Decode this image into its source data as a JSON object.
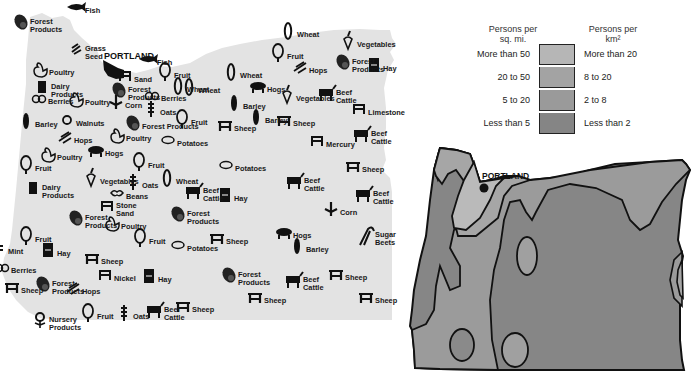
{
  "products_map": {
    "city": "PORTLAND",
    "state_fill": "#e4e4e4",
    "items": [
      {
        "label": "Fish",
        "icon": "fish-icon",
        "x": 88,
        "y": 11
      },
      {
        "label": "Forest\nProducts",
        "icon": "log-icon",
        "x": 33,
        "y": 26
      },
      {
        "label": "Grass\nSeed",
        "icon": "grass-seed-icon",
        "x": 88,
        "y": 53
      },
      {
        "label": "Poultry",
        "icon": "poultry-icon",
        "x": 52,
        "y": 73
      },
      {
        "label": "Dairy\nProducts",
        "icon": "dairy-icon",
        "x": 54,
        "y": 91
      },
      {
        "label": "Berries",
        "icon": "berries-icon",
        "x": 51,
        "y": 102
      },
      {
        "label": "Barley",
        "icon": "barley-icon",
        "x": 38,
        "y": 125
      },
      {
        "label": "Walnuts",
        "icon": "walnut-icon",
        "x": 79,
        "y": 124
      },
      {
        "label": "Hops",
        "icon": "hops-icon",
        "x": 77,
        "y": 141
      },
      {
        "label": "Poultry",
        "icon": "poultry-icon",
        "x": 88,
        "y": 103
      },
      {
        "label": "Sand",
        "icon": "sand-icon",
        "x": 137,
        "y": 80
      },
      {
        "label": "Forest\nProducts",
        "icon": "log-icon",
        "x": 131,
        "y": 94
      },
      {
        "label": "Corn",
        "icon": "corn-icon",
        "x": 128,
        "y": 106
      },
      {
        "label": "Fish",
        "icon": "fish-icon",
        "x": 160,
        "y": 63
      },
      {
        "label": "Fruit",
        "icon": "fruit-tree-icon",
        "x": 177,
        "y": 76
      },
      {
        "label": "Berries",
        "icon": "berries-icon",
        "x": 164,
        "y": 99
      },
      {
        "label": "Oats",
        "icon": "oats-icon",
        "x": 163,
        "y": 113
      },
      {
        "label": "Forest Products",
        "icon": "log-icon",
        "x": 145,
        "y": 127
      },
      {
        "label": "Wheat",
        "icon": "wheat-icon",
        "x": 201,
        "y": 91
      },
      {
        "label": "Fruit",
        "icon": "fruit-tree-icon",
        "x": 194,
        "y": 123
      },
      {
        "label": "Poultry",
        "icon": "poultry-icon",
        "x": 129,
        "y": 139
      },
      {
        "label": "Potatoes",
        "icon": "potato-icon",
        "x": 180,
        "y": 144
      },
      {
        "label": "Hogs",
        "icon": "hog-icon",
        "x": 108,
        "y": 154
      },
      {
        "label": "Poultry",
        "icon": "poultry-icon",
        "x": 60,
        "y": 158
      },
      {
        "label": "Fruit",
        "icon": "fruit-tree-icon",
        "x": 38,
        "y": 169
      },
      {
        "label": "Fruit",
        "icon": "fruit-tree-icon",
        "x": 151,
        "y": 166
      },
      {
        "label": "Vegetables",
        "icon": "vegetable-icon",
        "x": 103,
        "y": 182
      },
      {
        "label": "Wheat",
        "icon": "wheat-icon",
        "x": 179,
        "y": 182
      },
      {
        "label": "Oats",
        "icon": "oats-icon",
        "x": 145,
        "y": 186
      },
      {
        "label": "Beans",
        "icon": "beans-icon",
        "x": 129,
        "y": 197
      },
      {
        "label": "Dairy\nProducts",
        "icon": "dairy-icon",
        "x": 45,
        "y": 192
      },
      {
        "label": "Stone\nSand",
        "icon": "quarry-icon",
        "x": 119,
        "y": 210
      },
      {
        "label": "Forest\nProducts",
        "icon": "log-icon",
        "x": 88,
        "y": 222
      },
      {
        "label": "Poultry",
        "icon": "poultry-icon",
        "x": 124,
        "y": 227
      },
      {
        "label": "Forest\nProducts",
        "icon": "log-icon",
        "x": 190,
        "y": 218
      },
      {
        "label": "Fruit",
        "icon": "fruit-tree-icon",
        "x": 38,
        "y": 240
      },
      {
        "label": "Mint",
        "icon": "mint-icon",
        "x": 11,
        "y": 252
      },
      {
        "label": "Fruit",
        "icon": "fruit-tree-icon",
        "x": 152,
        "y": 242
      },
      {
        "label": "Potatoes",
        "icon": "potato-icon",
        "x": 190,
        "y": 249
      },
      {
        "label": "Hay",
        "icon": "hay-icon",
        "x": 60,
        "y": 254
      },
      {
        "label": "Sheep",
        "icon": "sheep-icon",
        "x": 104,
        "y": 262
      },
      {
        "label": "Berries",
        "icon": "berries-icon",
        "x": 14,
        "y": 271
      },
      {
        "label": "Nickel",
        "icon": "mine-icon",
        "x": 117,
        "y": 279
      },
      {
        "label": "Hay",
        "icon": "hay-icon",
        "x": 161,
        "y": 280
      },
      {
        "label": "Sheep",
        "icon": "sheep-icon",
        "x": 24,
        "y": 291
      },
      {
        "label": "Forest\nProducts",
        "icon": "log-icon",
        "x": 55,
        "y": 288
      },
      {
        "label": "Hops",
        "icon": "hops-icon",
        "x": 85,
        "y": 292
      },
      {
        "label": "Nursery\nProducts",
        "icon": "flower-icon",
        "x": 52,
        "y": 324
      },
      {
        "label": "Fruit",
        "icon": "fruit-tree-icon",
        "x": 100,
        "y": 317
      },
      {
        "label": "Oats",
        "icon": "oats-icon",
        "x": 136,
        "y": 317
      },
      {
        "label": "Beef\nCattle",
        "icon": "cattle-icon",
        "x": 167,
        "y": 314
      },
      {
        "label": "Sheep",
        "icon": "sheep-icon",
        "x": 195,
        "y": 310
      },
      {
        "label": "Wheat",
        "icon": "wheat-icon",
        "x": 300,
        "y": 35
      },
      {
        "label": "Vegetables",
        "icon": "vegetable-icon",
        "x": 360,
        "y": 45
      },
      {
        "label": "Fruit",
        "icon": "fruit-tree-icon",
        "x": 290,
        "y": 57
      },
      {
        "label": "Wheat",
        "icon": "wheat-icon",
        "x": 243,
        "y": 76
      },
      {
        "label": "Hops",
        "icon": "hops-icon",
        "x": 312,
        "y": 71
      },
      {
        "label": "Forest\nProducts",
        "icon": "log-icon",
        "x": 355,
        "y": 66
      },
      {
        "label": "Hay",
        "icon": "hay-icon",
        "x": 386,
        "y": 69
      },
      {
        "label": "Wheat",
        "icon": "wheat-icon",
        "x": 190,
        "y": 90
      },
      {
        "label": "Hogs",
        "icon": "hog-icon",
        "x": 270,
        "y": 90
      },
      {
        "label": "Vegetables",
        "icon": "vegetable-icon",
        "x": 299,
        "y": 99
      },
      {
        "label": "Beef\nCattle",
        "icon": "cattle-icon",
        "x": 339,
        "y": 97
      },
      {
        "label": "Barley",
        "icon": "barley-icon",
        "x": 246,
        "y": 107
      },
      {
        "label": "Barley",
        "icon": "barley-icon",
        "x": 268,
        "y": 121
      },
      {
        "label": "Sheep",
        "icon": "sheep-icon",
        "x": 296,
        "y": 124
      },
      {
        "label": "Sheep",
        "icon": "sheep-icon",
        "x": 237,
        "y": 129
      },
      {
        "label": "Limestone",
        "icon": "quarry-icon",
        "x": 371,
        "y": 113
      },
      {
        "label": "Beef\nCattle",
        "icon": "cattle-icon",
        "x": 374,
        "y": 138
      },
      {
        "label": "Mercury",
        "icon": "mine-icon",
        "x": 329,
        "y": 145
      },
      {
        "label": "Sheep",
        "icon": "sheep-icon",
        "x": 365,
        "y": 170
      },
      {
        "label": "Potatoes",
        "icon": "potato-icon",
        "x": 238,
        "y": 169
      },
      {
        "label": "Beef\nCattle",
        "icon": "cattle-icon",
        "x": 206,
        "y": 195
      },
      {
        "label": "Beef\nCattle",
        "icon": "cattle-icon",
        "x": 307,
        "y": 185
      },
      {
        "label": "Beef\nCattle",
        "icon": "cattle-icon",
        "x": 376,
        "y": 198
      },
      {
        "label": "Hay",
        "icon": "hay-icon",
        "x": 237,
        "y": 199
      },
      {
        "label": "Corn",
        "icon": "corn-icon",
        "x": 343,
        "y": 213
      },
      {
        "label": "Sugar\nBeets",
        "icon": "sugar-beet-icon",
        "x": 378,
        "y": 239
      },
      {
        "label": "Sheep",
        "icon": "sheep-icon",
        "x": 229,
        "y": 242
      },
      {
        "label": "Hogs",
        "icon": "hog-icon",
        "x": 296,
        "y": 236
      },
      {
        "label": "Barley",
        "icon": "barley-icon",
        "x": 309,
        "y": 250
      },
      {
        "label": "Forest\nProducts",
        "icon": "log-icon",
        "x": 241,
        "y": 279
      },
      {
        "label": "Beef\nCattle",
        "icon": "cattle-icon",
        "x": 306,
        "y": 284
      },
      {
        "label": "Sheep",
        "icon": "sheep-icon",
        "x": 348,
        "y": 278
      },
      {
        "label": "Sheep",
        "icon": "sheep-icon",
        "x": 267,
        "y": 301
      },
      {
        "label": "Sheep",
        "icon": "sheep-icon",
        "x": 378,
        "y": 301
      }
    ]
  },
  "density_legend": {
    "header_left": "Persons per\nsq. mi.",
    "header_right": "Persons per\nkm²",
    "rows": [
      {
        "left": "More than 50",
        "right": "More than 20",
        "color": "#b6b6b6"
      },
      {
        "left": "20 to 50",
        "right": "8 to 20",
        "color": "#a3a3a3"
      },
      {
        "left": "5 to 20",
        "right": "2 to 8",
        "color": "#9a9a9a"
      },
      {
        "left": "Less than 5",
        "right": "Less than 2",
        "color": "#858585"
      }
    ]
  },
  "density_map": {
    "city": "PORTLAND"
  }
}
